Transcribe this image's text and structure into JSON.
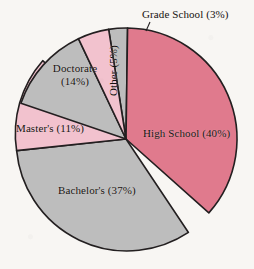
{
  "chart_data": {
    "type": "pie",
    "title": "",
    "subtitle": "",
    "xlabel": "",
    "ylabel": "",
    "legend_position": "none",
    "grid": false,
    "labels_inside": true,
    "categories": [
      "Grade School",
      "High School",
      "Bachelor's",
      "Master's",
      "Doctorate",
      "Other"
    ],
    "values": [
      3,
      40,
      37,
      11,
      14,
      5
    ],
    "units": "percent",
    "start_angle_deg": -9,
    "direction": "clockwise",
    "slices": [
      {
        "name": "Grade School",
        "value": 3,
        "label": "Grade School (3%)",
        "color": "#bdbdbd",
        "label_placement": "outside",
        "leader_line": true
      },
      {
        "name": "High School",
        "value": 40,
        "label": "High School (40%)",
        "color": "#e07a8d",
        "label_placement": "inside",
        "leader_line": false
      },
      {
        "name": "Bachelor's",
        "value": 37,
        "label": "Bachelor's (37%)",
        "color": "#bdbdbd",
        "label_placement": "inside",
        "leader_line": false
      },
      {
        "name": "Master's",
        "value": 11,
        "label": "Master's (11%)",
        "color": "#f2c2ce",
        "label_placement": "inside",
        "leader_line": false
      },
      {
        "name": "Doctorate",
        "value": 14,
        "label_line1": "Doctorate",
        "label_line2": "(14%)",
        "label": "Doctorate (14%)",
        "color": "#bdbdbd",
        "label_placement": "inside",
        "leader_line": false
      },
      {
        "name": "Other",
        "value": 5,
        "label": "Other (5%)",
        "color": "#f2c2ce",
        "label_placement": "inside",
        "label_rotation_deg": -90,
        "leader_line": false
      }
    ]
  },
  "figure": {
    "background_color": "#f8f6f3",
    "outline_color": "#231f20",
    "center_x": 126,
    "center_y": 139,
    "radius": 111
  },
  "labels": {
    "grade_school": "Grade School (3%)",
    "high_school": "High School (40%)",
    "bachelors": "Bachelor's (37%)",
    "masters": "Master's (11%)",
    "doctorate_line1": "Doctorate",
    "doctorate_line2": "(14%)",
    "other": "Other (5%)"
  }
}
